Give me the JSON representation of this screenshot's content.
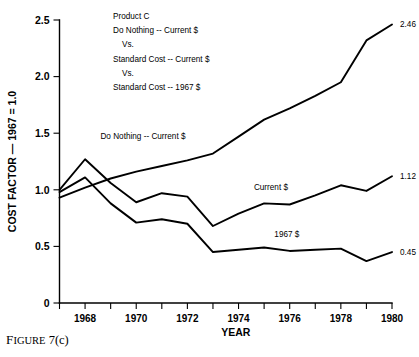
{
  "figure": {
    "caption_word": "F",
    "caption_rest": "IGURE",
    "caption_number": "7(c)"
  },
  "title_block": [
    "Product C",
    "Do Nothing -- Current $",
    "Vs.",
    "Standard Cost -- Current $",
    "Vs.",
    "Standard Cost -- 1967 $"
  ],
  "chart_data": {
    "type": "line",
    "title": "Product C",
    "xlabel": "YEAR",
    "ylabel": "COST FACTOR — 1967 = 1.0",
    "xlim": [
      1967,
      1980
    ],
    "ylim": [
      0,
      2.5
    ],
    "grid": false,
    "legend": "inline-annotations",
    "x": [
      1967,
      1968,
      1969,
      1970,
      1971,
      1972,
      1973,
      1974,
      1975,
      1976,
      1977,
      1978,
      1979,
      1980
    ],
    "xticks": [
      1967,
      1968,
      1969,
      1970,
      1971,
      1972,
      1973,
      1974,
      1975,
      1976,
      1977,
      1978,
      1979,
      1980
    ],
    "xtick_labels": [
      "",
      "1968",
      "",
      "1970",
      "",
      "1972",
      "",
      "1974",
      "",
      "1976",
      "",
      "1978",
      "",
      "1980"
    ],
    "yticks": [
      0,
      0.5,
      1.0,
      1.5,
      2.0,
      2.5
    ],
    "ytick_labels": [
      "0",
      "0.5",
      "1.0",
      "1.5",
      "2.0",
      "2.5"
    ],
    "series": [
      {
        "name": "Do Nothing -- Current $",
        "label": "Do Nothing -- Current $",
        "end_value_label": "2.46",
        "values": [
          0.93,
          1.02,
          1.1,
          1.16,
          1.21,
          1.26,
          1.32,
          1.47,
          1.62,
          1.72,
          1.83,
          1.95,
          2.32,
          2.46
        ]
      },
      {
        "name": "Standard Cost -- Current $",
        "label": "Current $",
        "end_value_label": "1.12",
        "values": [
          1.0,
          1.27,
          1.06,
          0.89,
          0.97,
          0.94,
          0.68,
          0.79,
          0.88,
          0.87,
          0.95,
          1.04,
          0.99,
          1.12
        ]
      },
      {
        "name": "Standard Cost -- 1967 $",
        "label": "1967 $",
        "end_value_label": "0.45",
        "values": [
          0.98,
          1.11,
          0.88,
          0.71,
          0.74,
          0.7,
          0.45,
          0.47,
          0.49,
          0.46,
          0.47,
          0.48,
          0.37,
          0.45
        ]
      }
    ],
    "annotations": [
      {
        "text": "Do Nothing -- Current $",
        "x": 1968.6,
        "y": 1.45
      },
      {
        "text": "Current $",
        "x": 1974.6,
        "y": 1.0
      },
      {
        "text": "1967 $",
        "x": 1975.4,
        "y": 0.58
      }
    ]
  }
}
